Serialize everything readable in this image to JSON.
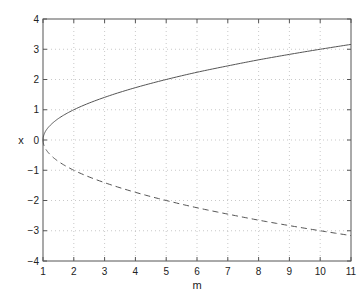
{
  "chart_data": {
    "type": "line",
    "title": "",
    "xlabel": "m",
    "ylabel": "x",
    "xlim": [
      1,
      11
    ],
    "ylim": [
      -4,
      4
    ],
    "xticks": [
      1,
      2,
      3,
      4,
      5,
      6,
      7,
      8,
      9,
      10,
      11
    ],
    "yticks": [
      -4,
      -3,
      -2,
      -1,
      0,
      1,
      2,
      3,
      4
    ],
    "xtick_labels": [
      "1",
      "2",
      "3",
      "4",
      "5",
      "6",
      "7",
      "8",
      "9",
      "10",
      "11"
    ],
    "ytick_labels": [
      "−4",
      "−3",
      "−2",
      "−1",
      "0",
      "1",
      "2",
      "3",
      "4"
    ],
    "grid": true,
    "legend": null,
    "series": [
      {
        "name": "upper branch",
        "style": "solid",
        "color": "#555555",
        "x": [
          1,
          1.1,
          1.25,
          1.5,
          2,
          3,
          4,
          5,
          6,
          7,
          8,
          9,
          10,
          11
        ],
        "values": [
          0,
          0.32,
          0.5,
          0.71,
          1.0,
          1.41,
          1.73,
          2.0,
          2.24,
          2.45,
          2.65,
          2.83,
          3.0,
          3.16
        ]
      },
      {
        "name": "lower branch",
        "style": "dashed",
        "color": "#555555",
        "x": [
          1,
          1.1,
          1.25,
          1.5,
          2,
          3,
          4,
          5,
          6,
          7,
          8,
          9,
          10,
          11
        ],
        "values": [
          0,
          -0.32,
          -0.5,
          -0.71,
          -1.0,
          -1.41,
          -1.73,
          -2.0,
          -2.24,
          -2.45,
          -2.65,
          -2.83,
          -3.0,
          -3.16
        ]
      }
    ]
  }
}
